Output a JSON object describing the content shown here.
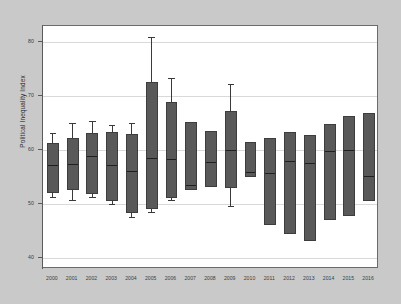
{
  "chart_data": {
    "type": "box",
    "title": "",
    "xlabel": "",
    "ylabel": "Political Inequality Index",
    "ylim": [
      38,
      83
    ],
    "yticks": [
      40,
      50,
      60,
      70,
      80
    ],
    "grid": true,
    "legend": null,
    "categories": [
      "2000",
      "2001",
      "2002",
      "2003",
      "2004",
      "2005",
      "2006",
      "2007",
      "2008",
      "2009",
      "2010",
      "2011",
      "2012",
      "2013",
      "2014",
      "2015",
      "2016"
    ],
    "boxes": [
      {
        "category": "2000",
        "whisker_low": 51.4,
        "q1": 52.0,
        "median": 57.3,
        "q3": 61.3,
        "whisker_high": 63.2
      },
      {
        "category": "2001",
        "whisker_low": 50.8,
        "q1": 52.6,
        "median": 57.4,
        "q3": 62.2,
        "whisker_high": 65.0
      },
      {
        "category": "2002",
        "whisker_low": 51.3,
        "q1": 51.9,
        "median": 58.9,
        "q3": 63.2,
        "whisker_high": 65.4
      },
      {
        "category": "2003",
        "whisker_low": 50.0,
        "q1": 50.6,
        "median": 57.2,
        "q3": 63.4,
        "whisker_high": 64.6
      },
      {
        "category": "2004",
        "whisker_low": 47.7,
        "q1": 48.4,
        "median": 56.1,
        "q3": 63.0,
        "whisker_high": 65.0
      },
      {
        "category": "2005",
        "whisker_low": 48.5,
        "q1": 49.2,
        "median": 58.5,
        "q3": 72.7,
        "whisker_high": 81.0
      },
      {
        "category": "2006",
        "whisker_low": 50.7,
        "q1": 51.2,
        "median": 58.4,
        "q3": 69.0,
        "whisker_high": 73.4
      },
      {
        "category": "2007",
        "whisker_low": null,
        "q1": 52.6,
        "median": 53.5,
        "q3": 65.3,
        "whisker_high": null
      },
      {
        "category": "2008",
        "whisker_low": null,
        "q1": 53.1,
        "median": 57.8,
        "q3": 63.6,
        "whisker_high": null
      },
      {
        "category": "2009",
        "whisker_low": 49.7,
        "q1": 53.0,
        "median": 60.0,
        "q3": 67.2,
        "whisker_high": 72.2
      },
      {
        "category": "2010",
        "whisker_low": null,
        "q1": 55.0,
        "median": 56.0,
        "q3": 61.6,
        "whisker_high": null
      },
      {
        "category": "2011",
        "whisker_low": null,
        "q1": 46.2,
        "median": 55.7,
        "q3": 62.2,
        "whisker_high": null
      },
      {
        "category": "2012",
        "whisker_low": null,
        "q1": 44.5,
        "median": 58.0,
        "q3": 63.4,
        "whisker_high": null
      },
      {
        "category": "2013",
        "whisker_low": null,
        "q1": 43.2,
        "median": 57.6,
        "q3": 62.8,
        "whisker_high": null
      },
      {
        "category": "2014",
        "whisker_low": null,
        "q1": 47.0,
        "median": 59.8,
        "q3": 64.8,
        "whisker_high": null
      },
      {
        "category": "2015",
        "whisker_low": null,
        "q1": 47.9,
        "median": 60.0,
        "q3": 66.3,
        "whisker_high": null
      },
      {
        "category": "2016",
        "whisker_low": null,
        "q1": 50.5,
        "median": 55.3,
        "q3": 66.8,
        "whisker_high": null
      }
    ]
  },
  "style": {
    "figure_background": "#c9c9c9",
    "plot_background": "#ffffff",
    "box_fill": "#595959",
    "box_edge": "#3d3d3d",
    "median_color": "#1f1f1f",
    "grid_color": "#d9d9d9",
    "axis_color": "#5a5a5a",
    "tick_label_color": "#3c3c3c"
  }
}
